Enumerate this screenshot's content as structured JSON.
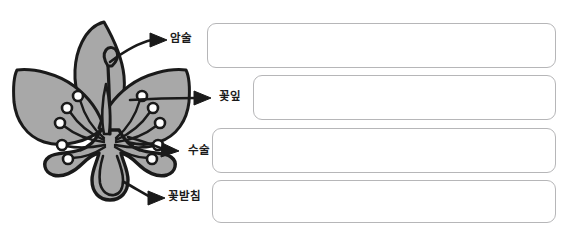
{
  "worksheet": {
    "title": "꽃의 구조 이름 쓰기 학습지",
    "background_color": "#ffffff"
  },
  "figure": {
    "name": "flower-cross-section-diagram",
    "petal_fill": "#a8a8a8",
    "outline_color": "#1a1a1a"
  },
  "callouts": [
    {
      "id": "pistil",
      "label": "암술",
      "arrow": "arrow-to-pistil",
      "answer_value": "",
      "answer_placeholder": ""
    },
    {
      "id": "petal",
      "label": "꽃잎",
      "arrow": "arrow-to-petal",
      "answer_value": "",
      "answer_placeholder": ""
    },
    {
      "id": "stamen",
      "label": "수술",
      "arrow": "arrow-to-stamen",
      "answer_value": "",
      "answer_placeholder": ""
    },
    {
      "id": "sepal",
      "label": "꽃받침",
      "arrow": "arrow-to-sepal",
      "answer_value": "",
      "answer_placeholder": ""
    }
  ]
}
